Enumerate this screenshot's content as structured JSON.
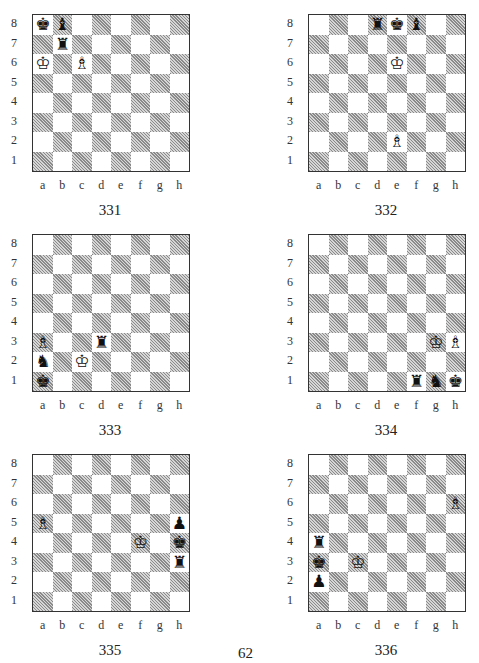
{
  "page": {
    "number": "62"
  },
  "files": [
    "a",
    "b",
    "c",
    "d",
    "e",
    "f",
    "g",
    "h"
  ],
  "ranks": [
    "8",
    "7",
    "6",
    "5",
    "4",
    "3",
    "2",
    "1"
  ],
  "diagrams": [
    {
      "id": "331",
      "label": "331",
      "x": 0,
      "y": 14,
      "pieces": [
        {
          "square": "a8",
          "color": "black",
          "type": "king",
          "glyph": "♚"
        },
        {
          "square": "b8",
          "color": "black",
          "type": "bishop",
          "glyph": "♝"
        },
        {
          "square": "b7",
          "color": "black",
          "type": "rook",
          "glyph": "♜"
        },
        {
          "square": "a6",
          "color": "white",
          "type": "king",
          "glyph": "♔"
        },
        {
          "square": "c6",
          "color": "white",
          "type": "bishop",
          "glyph": "♗"
        }
      ]
    },
    {
      "id": "332",
      "label": "332",
      "x": 276,
      "y": 14,
      "pieces": [
        {
          "square": "d8",
          "color": "black",
          "type": "rook",
          "glyph": "♜"
        },
        {
          "square": "e8",
          "color": "black",
          "type": "king",
          "glyph": "♚"
        },
        {
          "square": "f8",
          "color": "black",
          "type": "bishop",
          "glyph": "♝"
        },
        {
          "square": "e6",
          "color": "white",
          "type": "king",
          "glyph": "♔"
        },
        {
          "square": "e2",
          "color": "white",
          "type": "bishop",
          "glyph": "♗"
        }
      ]
    },
    {
      "id": "333",
      "label": "333",
      "x": 0,
      "y": 234,
      "pieces": [
        {
          "square": "a3",
          "color": "white",
          "type": "bishop",
          "glyph": "♗"
        },
        {
          "square": "d3",
          "color": "black",
          "type": "rook",
          "glyph": "♜"
        },
        {
          "square": "a2",
          "color": "black",
          "type": "knight",
          "glyph": "♞"
        },
        {
          "square": "c2",
          "color": "white",
          "type": "king",
          "glyph": "♔"
        },
        {
          "square": "a1",
          "color": "black",
          "type": "king",
          "glyph": "♚"
        }
      ]
    },
    {
      "id": "334",
      "label": "334",
      "x": 276,
      "y": 234,
      "pieces": [
        {
          "square": "g3",
          "color": "white",
          "type": "king",
          "glyph": "♔"
        },
        {
          "square": "h3",
          "color": "white",
          "type": "bishop",
          "glyph": "♗"
        },
        {
          "square": "f1",
          "color": "black",
          "type": "rook",
          "glyph": "♜"
        },
        {
          "square": "g1",
          "color": "black",
          "type": "knight",
          "glyph": "♞"
        },
        {
          "square": "h1",
          "color": "black",
          "type": "king",
          "glyph": "♚"
        }
      ]
    },
    {
      "id": "335",
      "label": "335",
      "x": 0,
      "y": 454,
      "pieces": [
        {
          "square": "a5",
          "color": "white",
          "type": "bishop",
          "glyph": "♗"
        },
        {
          "square": "h5",
          "color": "black",
          "type": "pawn",
          "glyph": "♟"
        },
        {
          "square": "f4",
          "color": "white",
          "type": "king",
          "glyph": "♔"
        },
        {
          "square": "h4",
          "color": "black",
          "type": "king",
          "glyph": "♚"
        },
        {
          "square": "h3",
          "color": "black",
          "type": "rook",
          "glyph": "♜"
        }
      ]
    },
    {
      "id": "336",
      "label": "336",
      "x": 276,
      "y": 454,
      "pieces": [
        {
          "square": "h6",
          "color": "white",
          "type": "bishop",
          "glyph": "♗"
        },
        {
          "square": "a4",
          "color": "black",
          "type": "rook",
          "glyph": "♜"
        },
        {
          "square": "a3",
          "color": "black",
          "type": "king",
          "glyph": "♚"
        },
        {
          "square": "c3",
          "color": "white",
          "type": "king",
          "glyph": "♔"
        },
        {
          "square": "a2",
          "color": "black",
          "type": "pawn",
          "glyph": "♟"
        }
      ]
    }
  ]
}
